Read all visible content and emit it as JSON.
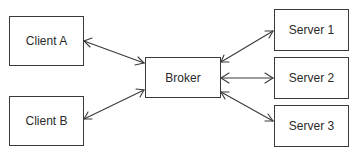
{
  "diagram": {
    "type": "client-broker-server architecture",
    "nodes": {
      "client_a": {
        "label": "Client A"
      },
      "client_b": {
        "label": "Client B"
      },
      "broker": {
        "label": "Broker"
      },
      "server_1": {
        "label": "Server 1"
      },
      "server_2": {
        "label": "Server 2"
      },
      "server_3": {
        "label": "Server 3"
      }
    },
    "edges": [
      {
        "from": "Client A",
        "to": "Broker",
        "direction": "bidirectional"
      },
      {
        "from": "Client B",
        "to": "Broker",
        "direction": "bidirectional"
      },
      {
        "from": "Broker",
        "to": "Server 1",
        "direction": "bidirectional"
      },
      {
        "from": "Broker",
        "to": "Server 2",
        "direction": "bidirectional"
      },
      {
        "from": "Broker",
        "to": "Server 3",
        "direction": "bidirectional"
      }
    ],
    "colors": {
      "stroke": "#3a3a3a",
      "background": "#ffffff",
      "text": "#2a2a2a"
    }
  }
}
